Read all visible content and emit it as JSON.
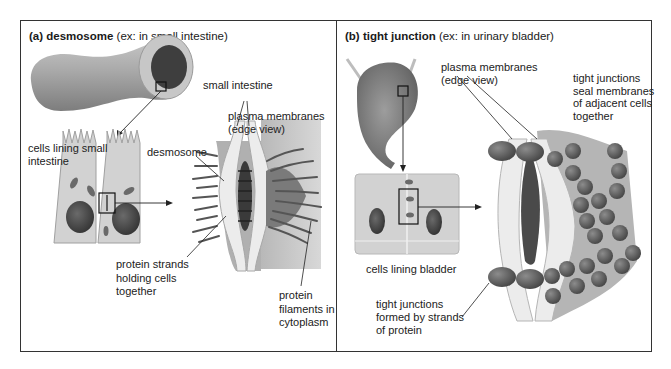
{
  "panels": [
    {
      "id": "a",
      "title_bold": "(a) desmosome",
      "title_rest": " (ex: in small intestine)",
      "labels": {
        "organ": "small intestine",
        "cells": [
          "cells lining small",
          "intestine"
        ],
        "membranes": [
          "plasma membranes",
          "(edge view)"
        ],
        "junction": "desmosome",
        "strands": [
          "protein strands",
          "holding cells",
          "together"
        ],
        "filaments": [
          "protein",
          "filaments in",
          "cytoplasm"
        ]
      }
    },
    {
      "id": "b",
      "title_bold": "(b) tight junction",
      "title_rest": " (ex: in urinary bladder)",
      "labels": {
        "membranes": [
          "plasma membranes",
          "(edge view)"
        ],
        "seal": [
          "tight junctions",
          "seal membranes",
          "of adjacent cells",
          "together"
        ],
        "cells": "cells lining bladder",
        "formed": [
          "tight junctions",
          "formed by strands",
          "of protein"
        ]
      }
    }
  ],
  "colors": {
    "border": "#333333",
    "tissue_light": "#d6d6d6",
    "tissue_mid": "#9a9a9a",
    "tissue_dark": "#555555",
    "nucleus": "#4a4a4a",
    "membrane": "#eeeeee"
  }
}
